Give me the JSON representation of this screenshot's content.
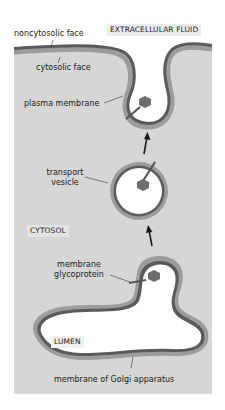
{
  "diagram": {
    "type": "exocytosis pathway schematic",
    "regions": {
      "extracellular": "EXTRACELLULAR FLUID",
      "cytosol": "CYTOSOL",
      "lumen": "LUMEN"
    },
    "labels": {
      "noncytosolic_face": "noncytosolic face",
      "cytosolic_face": "cytosolic face",
      "plasma_membrane": "plasma membrane",
      "transport_vesicle_line1": "transport",
      "transport_vesicle_line2": "vesicle",
      "glycoprotein_line1": "membrane",
      "glycoprotein_line2": "glycoprotein",
      "golgi_membrane": "membrane of Golgi apparatus"
    },
    "colors": {
      "cytosol": "#d6d6d6",
      "noncytosolic_layer": "#5a5a5a",
      "cytosolic_layer": "#9c9c9c",
      "lumen": "#ffffff",
      "protein": "#6e6e6e",
      "label_box": "#e4e4e4"
    },
    "arrows": [
      {
        "from": "golgi",
        "to": "transport vesicle",
        "direction": "up"
      },
      {
        "from": "transport vesicle",
        "to": "plasma membrane",
        "direction": "up"
      }
    ]
  }
}
